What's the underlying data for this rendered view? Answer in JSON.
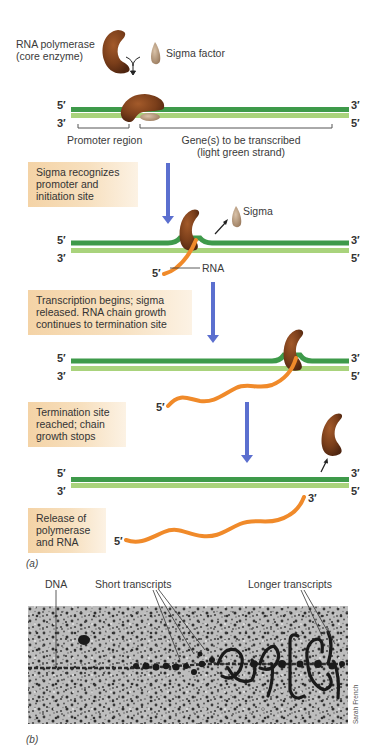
{
  "panel_a": {
    "label": "(a)",
    "initial": {
      "polymerase_label_line1": "RNA polymerase",
      "polymerase_label_line2": "(core enzyme)",
      "sigma_label": "Sigma factor"
    },
    "strand_labels": {
      "five_prime": "5′",
      "three_prime": "3′"
    },
    "regions": {
      "promoter": "Promoter region",
      "gene_line1": "Gene(s) to be transcribed",
      "gene_line2": "(light green strand)"
    },
    "steps": [
      {
        "text": "Sigma recognizes\npromoter and\ninitiation site",
        "free_label": "Sigma",
        "rna_label": "RNA"
      },
      {
        "text": "Transcription begins; sigma\nreleased. RNA chain growth\ncontinues to termination site"
      },
      {
        "text": "Termination site\nreached;  chain\ngrowth stops"
      },
      {
        "text": "Release of\npolymerase\nand RNA"
      }
    ]
  },
  "panel_b": {
    "label": "(b)",
    "labels": {
      "dna": "DNA",
      "short": "Short transcripts",
      "longer": "Longer transcripts"
    },
    "credit": "Sarah French"
  },
  "colors": {
    "dark_strand": "#3e9a4a",
    "light_strand": "#a9d37c",
    "rna": "#f08a2a",
    "polymerase": "#7a3e1a",
    "sigma": "#b79a80",
    "arrow": "#5b6fcf",
    "step_box": "#f4d3a6"
  }
}
